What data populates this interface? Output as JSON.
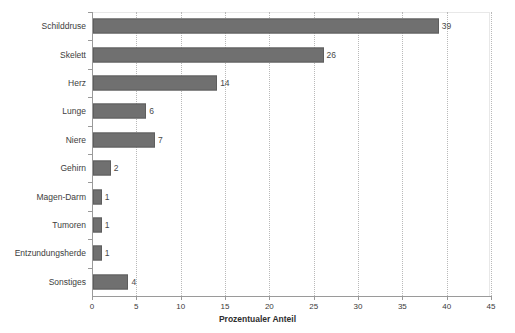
{
  "chart_data": {
    "type": "bar",
    "orientation": "horizontal",
    "title": "",
    "xlabel": "Prozentualer Anteil",
    "ylabel": "",
    "xlim": [
      0,
      45
    ],
    "xticks": [
      0,
      5,
      10,
      15,
      20,
      25,
      30,
      35,
      40,
      45
    ],
    "grid": "vertical-dotted",
    "legend": "none",
    "bar_color": "#707070",
    "categories": [
      "Schilddruse",
      "Skelett",
      "Herz",
      "Lunge",
      "Niere",
      "Gehirn",
      "Magen-Darm",
      "Tumoren",
      "Entzundungsherde",
      "Sonstiges"
    ],
    "values": [
      39,
      26,
      14,
      6,
      7,
      2,
      1,
      1,
      1,
      4
    ],
    "value_labels": [
      "39",
      "26",
      "14",
      "6",
      "7",
      "2",
      "1",
      "1",
      "1",
      "4"
    ]
  }
}
